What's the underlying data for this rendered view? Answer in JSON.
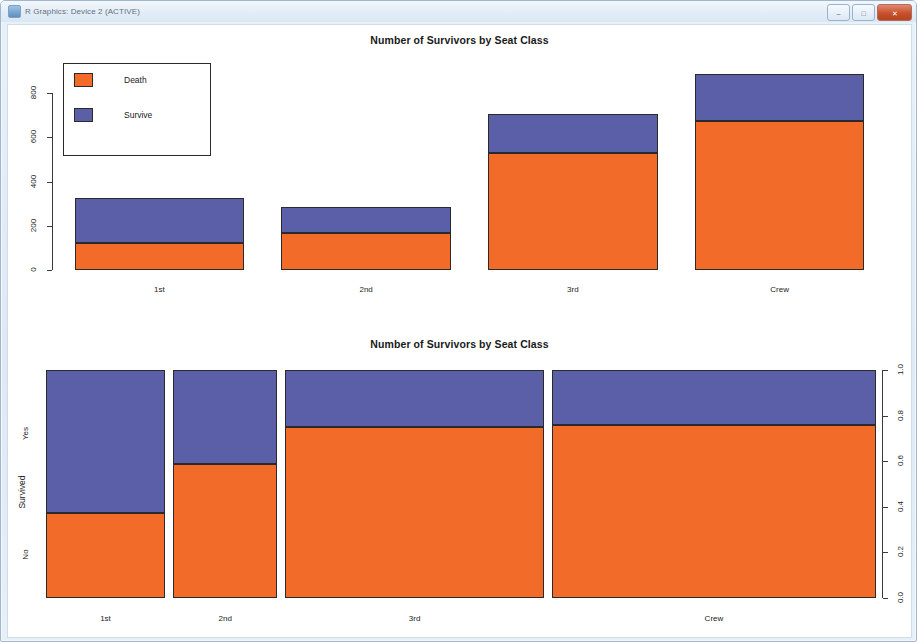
{
  "window": {
    "title": "R Graphics: Device 2 (ACTIVE)",
    "icon": "r-graphics-icon",
    "buttons": {
      "minimize": "–",
      "maximize": "□",
      "close": "✕"
    }
  },
  "colors": {
    "death": "#F26B28",
    "survive": "#5B5FA8",
    "axis": "#3a3a3a",
    "background": "#ffffff"
  },
  "legend": {
    "items": [
      {
        "label": "Death",
        "color_key": "death"
      },
      {
        "label": "Survive",
        "color_key": "survive"
      }
    ]
  },
  "chart_data": [
    {
      "id": "stacked-bar",
      "type": "bar",
      "stacked": true,
      "title": "Number of Survivors by Seat Class",
      "xlabel": "",
      "ylabel": "",
      "categories": [
        "1st",
        "2nd",
        "3rd",
        "Crew"
      ],
      "ytick_labels": [
        "0",
        "200",
        "400",
        "600",
        "800"
      ],
      "ytick_values": [
        0,
        200,
        400,
        600,
        800
      ],
      "ylim": [
        0,
        900
      ],
      "grid": false,
      "legend_position": "top-left",
      "series": [
        {
          "name": "Death",
          "values": [
            122,
            167,
            528,
            673
          ]
        },
        {
          "name": "Survive",
          "values": [
            203,
            118,
            178,
            212
          ]
        }
      ],
      "totals": [
        325,
        285,
        706,
        885
      ]
    },
    {
      "id": "mosaic",
      "type": "bar",
      "stacked": true,
      "proportional": true,
      "title": "Number of Survivors by Seat Class",
      "xlabel": "Class",
      "ylabel": "Survived",
      "categories": [
        "1st",
        "2nd",
        "3rd",
        "Crew"
      ],
      "category_widths": [
        325,
        285,
        706,
        885
      ],
      "ytick_labels": [
        "0.0",
        "0.2",
        "0.4",
        "0.6",
        "0.8",
        "1.0"
      ],
      "ytick_values": [
        0.0,
        0.2,
        0.4,
        0.6,
        0.8,
        1.0
      ],
      "ylim": [
        0,
        1
      ],
      "y_category_labels": [
        "No",
        "Yes"
      ],
      "grid": false,
      "legend_position": "none",
      "series": [
        {
          "name": "Death (No)",
          "values": [
            0.375,
            0.586,
            0.748,
            0.76
          ]
        },
        {
          "name": "Survive (Yes)",
          "values": [
            0.625,
            0.414,
            0.252,
            0.24
          ]
        }
      ]
    }
  ]
}
